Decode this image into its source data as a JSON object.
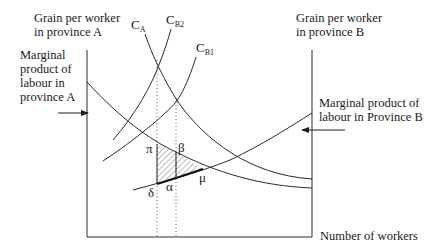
{
  "diagram": {
    "axis_left_label_line1": "Grain per worker",
    "axis_left_label_line2": "in province A",
    "axis_right_label_line1": "Grain per worker",
    "axis_right_label_line2": "in province B",
    "x_axis_label": "Number of workers",
    "mpl_a_label": [
      "Marginal",
      "product of",
      "labour in",
      "province A"
    ],
    "mpl_b_label": [
      "Marginal product of",
      "labour in Province B"
    ],
    "curves": {
      "ca": {
        "main": "C",
        "sub": "A"
      },
      "cb2": {
        "main": "C",
        "sub": "B2"
      },
      "cb1": {
        "main": "C",
        "sub": "B1"
      }
    },
    "points": {
      "pi": "π",
      "beta": "β",
      "delta": "δ",
      "alpha": "α",
      "mu": "μ"
    },
    "colors": {
      "line": "#2a2a2a",
      "hatch": "#555555",
      "background": "#ffffff"
    }
  }
}
